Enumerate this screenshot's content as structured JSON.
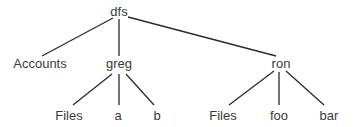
{
  "diagram": {
    "type": "tree",
    "line_color": "#2a2a2a",
    "nodes": [
      {
        "id": "dfs",
        "label": "dfs",
        "x": 119,
        "y": 11
      },
      {
        "id": "accounts",
        "label": "Accounts",
        "x": 40,
        "y": 63
      },
      {
        "id": "greg",
        "label": "greg",
        "x": 119,
        "y": 63
      },
      {
        "id": "ron",
        "label": "ron",
        "x": 281,
        "y": 63
      },
      {
        "id": "greg_files",
        "label": "Files",
        "x": 69,
        "y": 115
      },
      {
        "id": "greg_a",
        "label": "a",
        "x": 118,
        "y": 115
      },
      {
        "id": "greg_b",
        "label": "b",
        "x": 157,
        "y": 115
      },
      {
        "id": "ron_files",
        "label": "Files",
        "x": 223,
        "y": 115
      },
      {
        "id": "ron_foo",
        "label": "foo",
        "x": 279,
        "y": 115
      },
      {
        "id": "ron_bar",
        "label": "bar",
        "x": 329,
        "y": 115
      }
    ],
    "edges": [
      {
        "from": "dfs",
        "to": "accounts",
        "x1": 113,
        "y1": 18,
        "x2": 42,
        "y2": 56
      },
      {
        "from": "dfs",
        "to": "greg",
        "x1": 119,
        "y1": 19,
        "x2": 119,
        "y2": 56
      },
      {
        "from": "dfs",
        "to": "ron",
        "x1": 128,
        "y1": 17,
        "x2": 276,
        "y2": 56
      },
      {
        "from": "greg",
        "to": "greg_files",
        "x1": 112,
        "y1": 74,
        "x2": 73,
        "y2": 105
      },
      {
        "from": "greg",
        "to": "greg_a",
        "x1": 119,
        "y1": 74,
        "x2": 119,
        "y2": 105
      },
      {
        "from": "greg",
        "to": "greg_b",
        "x1": 126,
        "y1": 74,
        "x2": 154,
        "y2": 105
      },
      {
        "from": "ron",
        "to": "ron_files",
        "x1": 274,
        "y1": 71,
        "x2": 229,
        "y2": 105
      },
      {
        "from": "ron",
        "to": "ron_foo",
        "x1": 279,
        "y1": 72,
        "x2": 279,
        "y2": 105
      },
      {
        "from": "ron",
        "to": "ron_bar",
        "x1": 286,
        "y1": 71,
        "x2": 324,
        "y2": 105
      }
    ]
  }
}
